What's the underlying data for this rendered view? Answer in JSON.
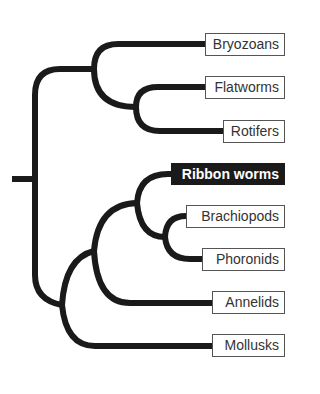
{
  "diagram": {
    "type": "phylogenetic-tree",
    "highlighted_taxon": "Ribbon worms",
    "colors": {
      "branch": "#1a1a1a",
      "highlight_bg": "#1a1a1a",
      "highlight_text": "#ffffff",
      "box_border": "#555555"
    },
    "taxa": [
      {
        "name": "Bryozoans",
        "highlighted": false
      },
      {
        "name": "Flatworms",
        "highlighted": false
      },
      {
        "name": "Rotifers",
        "highlighted": false
      },
      {
        "name": "Ribbon worms",
        "highlighted": true
      },
      {
        "name": "Brachiopods",
        "highlighted": false
      },
      {
        "name": "Phoronids",
        "highlighted": false
      },
      {
        "name": "Annelids",
        "highlighted": false
      },
      {
        "name": "Mollusks",
        "highlighted": false
      }
    ],
    "topology": "((Bryozoans,(Flatworms,Rotifers)),(((Ribbon worms,(Brachiopods,Phoronids)),Annelids),Mollusks))"
  }
}
